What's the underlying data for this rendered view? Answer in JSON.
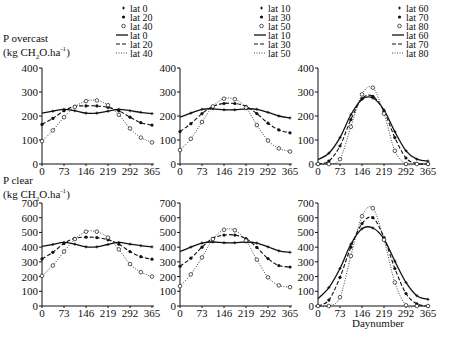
{
  "figure": {
    "top_ylabel_line1": "P overcast",
    "top_ylabel_line2": "(kg CH",
    "top_ylabel_sub": "2",
    "top_ylabel_line2b": "O.ha",
    "top_ylabel_sup": "-1",
    "top_ylabel_line2c": ")",
    "bottom_ylabel_line1": "P clear",
    "bottom_ylabel_line2": "(kg CH",
    "bottom_ylabel_sub": "2",
    "bottom_ylabel_line2b": "O.ha",
    "bottom_ylabel_sup": "-1",
    "bottom_ylabel_line2c": ")",
    "xlabel": "Daynumber"
  },
  "legends": [
    {
      "entries": [
        {
          "symbol": "+",
          "label": "lat 0"
        },
        {
          "symbol": "•",
          "label": "lat 20"
        },
        {
          "symbol": "o",
          "label": "lat 40"
        },
        {
          "symbol": "solid",
          "label": "lat 0"
        },
        {
          "symbol": "dashed",
          "label": "lat 20"
        },
        {
          "symbol": "dotted",
          "label": "lat 40"
        }
      ]
    },
    {
      "entries": [
        {
          "symbol": "+",
          "label": "lat 10"
        },
        {
          "symbol": "•",
          "label": "lat 30"
        },
        {
          "symbol": "o",
          "label": "lat 50"
        },
        {
          "symbol": "solid",
          "label": "lat 10"
        },
        {
          "symbol": "dashed",
          "label": "lat 30"
        },
        {
          "symbol": "dotted",
          "label": "lat 50"
        }
      ]
    },
    {
      "entries": [
        {
          "symbol": "+",
          "label": "lat 60"
        },
        {
          "symbol": "•",
          "label": "lat 70"
        },
        {
          "symbol": "o",
          "label": "lat 80"
        },
        {
          "symbol": "solid",
          "label": "lat 60"
        },
        {
          "symbol": "dashed",
          "label": "lat 70"
        },
        {
          "symbol": "dotted",
          "label": "lat 80"
        }
      ]
    }
  ],
  "chart_data": [
    {
      "type": "line",
      "panel": "top-left",
      "title": "P overcast (kg CH2O.ha-1)",
      "xlabel": "",
      "ylabel": "P overcast (kg CH2O.ha-1)",
      "xticks": [
        0,
        73,
        146,
        219,
        292,
        365
      ],
      "yticks": [
        0,
        100,
        200,
        300,
        400
      ],
      "ylim": [
        0,
        400
      ],
      "xlim": [
        0,
        365
      ],
      "grid": false,
      "x": [
        0,
        36,
        73,
        109,
        146,
        182,
        219,
        255,
        292,
        328,
        365
      ],
      "series": [
        {
          "name": "lat 0",
          "style": "solid",
          "marker": "+",
          "values": [
            212,
            220,
            228,
            222,
            212,
            212,
            220,
            228,
            222,
            215,
            210
          ]
        },
        {
          "name": "lat 20",
          "style": "dashed",
          "marker": "•",
          "values": [
            165,
            190,
            222,
            240,
            242,
            242,
            236,
            222,
            195,
            172,
            162
          ]
        },
        {
          "name": "lat 40",
          "style": "dotted",
          "marker": "o",
          "values": [
            95,
            140,
            195,
            238,
            262,
            265,
            245,
            205,
            148,
            110,
            90
          ]
        }
      ]
    },
    {
      "type": "line",
      "panel": "top-middle",
      "xticks": [
        0,
        73,
        146,
        219,
        292,
        365
      ],
      "yticks": [
        0,
        100,
        200,
        300,
        400
      ],
      "ylim": [
        0,
        400
      ],
      "xlim": [
        0,
        365
      ],
      "grid": false,
      "x": [
        0,
        36,
        73,
        109,
        146,
        182,
        219,
        255,
        292,
        328,
        365
      ],
      "series": [
        {
          "name": "lat 10",
          "style": "solid",
          "marker": "+",
          "values": [
            195,
            212,
            228,
            230,
            226,
            226,
            230,
            228,
            215,
            200,
            192
          ]
        },
        {
          "name": "lat 30",
          "style": "dashed",
          "marker": "•",
          "values": [
            135,
            168,
            210,
            240,
            252,
            252,
            240,
            210,
            170,
            142,
            130
          ]
        },
        {
          "name": "lat 50",
          "style": "dotted",
          "marker": "o",
          "values": [
            58,
            105,
            175,
            240,
            272,
            270,
            235,
            162,
            98,
            65,
            52
          ]
        }
      ]
    },
    {
      "type": "line",
      "panel": "top-right",
      "xticks": [
        0,
        73,
        146,
        219,
        292,
        365
      ],
      "yticks": [
        0,
        100,
        200,
        300,
        400
      ],
      "ylim": [
        0,
        400
      ],
      "xlim": [
        0,
        365
      ],
      "grid": false,
      "x": [
        0,
        36,
        73,
        109,
        146,
        182,
        219,
        255,
        292,
        328,
        365
      ],
      "series": [
        {
          "name": "lat 60",
          "style": "solid",
          "marker": "+",
          "values": [
            18,
            45,
            110,
            205,
            270,
            275,
            225,
            135,
            55,
            20,
            12
          ]
        },
        {
          "name": "lat 70",
          "style": "dashed",
          "marker": "•",
          "values": [
            0,
            12,
            75,
            185,
            272,
            282,
            220,
            110,
            25,
            2,
            0
          ]
        },
        {
          "name": "lat 80",
          "style": "dotted",
          "marker": "o",
          "values": [
            0,
            0,
            20,
            155,
            290,
            318,
            210,
            55,
            0,
            0,
            0
          ]
        }
      ]
    },
    {
      "type": "line",
      "panel": "bottom-left",
      "ylabel": "P clear (kg CH2O.ha-1)",
      "xticks": [
        0,
        73,
        146,
        219,
        292,
        365
      ],
      "yticks": [
        0,
        100,
        200,
        300,
        400,
        500,
        600,
        700
      ],
      "ylim": [
        0,
        700
      ],
      "xlim": [
        0,
        365
      ],
      "grid": false,
      "x": [
        0,
        36,
        73,
        109,
        146,
        182,
        219,
        255,
        292,
        328,
        365
      ],
      "series": [
        {
          "name": "lat 0",
          "style": "solid",
          "marker": "+",
          "values": [
            405,
            418,
            432,
            420,
            402,
            402,
            418,
            432,
            420,
            410,
            402
          ]
        },
        {
          "name": "lat 20",
          "style": "dashed",
          "marker": "•",
          "values": [
            320,
            365,
            425,
            460,
            468,
            465,
            450,
            420,
            370,
            335,
            318
          ]
        },
        {
          "name": "lat 40",
          "style": "dotted",
          "marker": "o",
          "values": [
            205,
            275,
            370,
            455,
            505,
            505,
            465,
            385,
            285,
            230,
            200
          ]
        }
      ]
    },
    {
      "type": "line",
      "panel": "bottom-middle",
      "xticks": [
        0,
        73,
        146,
        219,
        292,
        365
      ],
      "yticks": [
        0,
        100,
        200,
        300,
        400,
        500,
        600,
        700
      ],
      "ylim": [
        0,
        700
      ],
      "xlim": [
        0,
        365
      ],
      "grid": false,
      "x": [
        0,
        36,
        73,
        109,
        146,
        182,
        219,
        255,
        292,
        328,
        365
      ],
      "series": [
        {
          "name": "lat 10",
          "style": "solid",
          "marker": "+",
          "values": [
            370,
            400,
            428,
            435,
            430,
            430,
            435,
            428,
            402,
            375,
            365
          ]
        },
        {
          "name": "lat 30",
          "style": "dashed",
          "marker": "•",
          "values": [
            270,
            325,
            400,
            460,
            482,
            482,
            458,
            398,
            322,
            275,
            265
          ]
        },
        {
          "name": "lat 50",
          "style": "dotted",
          "marker": "o",
          "values": [
            135,
            215,
            330,
            455,
            518,
            515,
            445,
            315,
            195,
            140,
            128
          ]
        }
      ]
    },
    {
      "type": "line",
      "panel": "bottom-right",
      "xlabel": "Daynumber",
      "xticks": [
        0,
        73,
        146,
        219,
        292,
        365
      ],
      "yticks": [
        0,
        100,
        200,
        300,
        400,
        500,
        600,
        700
      ],
      "ylim": [
        0,
        700
      ],
      "xlim": [
        0,
        365
      ],
      "grid": false,
      "x": [
        0,
        36,
        73,
        109,
        146,
        182,
        219,
        255,
        292,
        328,
        365
      ],
      "series": [
        {
          "name": "lat 60",
          "style": "solid",
          "marker": "+",
          "values": [
            50,
            125,
            255,
            420,
            525,
            530,
            455,
            305,
            160,
            70,
            45
          ]
        },
        {
          "name": "lat 70",
          "style": "dashed",
          "marker": "•",
          "values": [
            0,
            40,
            195,
            400,
            560,
            600,
            465,
            255,
            85,
            15,
            0
          ]
        },
        {
          "name": "lat 80",
          "style": "dotted",
          "marker": "o",
          "values": [
            0,
            0,
            60,
            340,
            610,
            665,
            450,
            160,
            5,
            0,
            0
          ]
        }
      ]
    }
  ]
}
